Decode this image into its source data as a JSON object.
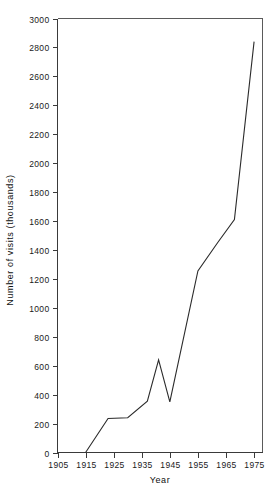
{
  "chart_data": {
    "type": "line",
    "title": "",
    "xlabel": "Year",
    "ylabel": "Number of visits (thousands)",
    "x": [
      1915,
      1923,
      1930,
      1937,
      1941,
      1945,
      1955,
      1962,
      1968,
      1975
    ],
    "values": [
      0,
      235,
      240,
      355,
      640,
      350,
      1255,
      1450,
      1610,
      2840
    ],
    "series": [
      {
        "name": "Number of visits",
        "values": [
          0,
          235,
          240,
          355,
          640,
          350,
          1255,
          1450,
          1610,
          2840
        ]
      }
    ],
    "xlim": [
      1905,
      1978
    ],
    "ylim": [
      0,
      3000
    ],
    "xticks": [
      1905,
      1915,
      1925,
      1935,
      1945,
      1955,
      1965,
      1975
    ],
    "xtick_labels": [
      "1905",
      "1915",
      "1925",
      "1935",
      "1945",
      "1955",
      "1965",
      "1975"
    ],
    "yticks": [
      0,
      200,
      400,
      600,
      800,
      1000,
      1200,
      1400,
      1600,
      1800,
      2000,
      2200,
      2400,
      2600,
      2800,
      3000
    ],
    "ytick_labels": [
      "0",
      "200",
      "400",
      "600",
      "800",
      "1000",
      "1200",
      "1400",
      "1600",
      "1800",
      "2000",
      "2200",
      "2400",
      "2600",
      "2800",
      "3000"
    ],
    "grid": false,
    "legend": "none",
    "line_color": "#2b2b2b",
    "axis_color": "#3a3a3a",
    "background_color": "#ffffff"
  },
  "axes": {
    "x_title": "Year",
    "y_title": "Number of visits (thousands)"
  }
}
